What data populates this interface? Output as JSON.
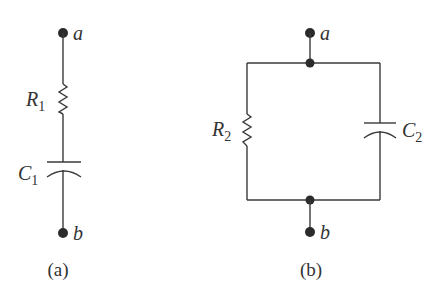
{
  "figure": {
    "circuit_a": {
      "caption": "(a)",
      "terminal_top": "a",
      "terminal_bottom": "b",
      "resistor": {
        "symbol": "R",
        "subscript": "1"
      },
      "capacitor": {
        "symbol": "C",
        "subscript": "1"
      },
      "topology": "series"
    },
    "circuit_b": {
      "caption": "(b)",
      "terminal_top": "a",
      "terminal_bottom": "b",
      "resistor": {
        "symbol": "R",
        "subscript": "2"
      },
      "capacitor": {
        "symbol": "C",
        "subscript": "2"
      },
      "topology": "parallel"
    }
  },
  "colors": {
    "wire": "#3a3a3a",
    "node": "#2b2b2b",
    "text": "#333333",
    "background": "#ffffff"
  }
}
